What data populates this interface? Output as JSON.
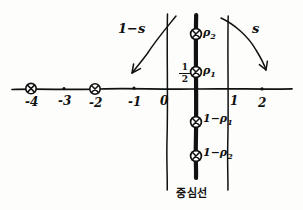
{
  "figure": {
    "kind": "hand-drawn-diagram",
    "ink_color": "#111111",
    "paper_color": "#fdfdfb"
  },
  "axis": {
    "label": "real axis",
    "ticks": [
      {
        "value": "-4",
        "x": 31,
        "marker": "circled-x"
      },
      {
        "value": "-3",
        "x": 64,
        "marker": "dot"
      },
      {
        "value": "-2",
        "x": 95,
        "marker": "circled-x"
      },
      {
        "value": "-1",
        "x": 134,
        "marker": "dot"
      },
      {
        "value": "0",
        "x": 167,
        "marker": "line"
      },
      {
        "value": "1",
        "x": 228,
        "marker": "line"
      },
      {
        "value": "2",
        "x": 262,
        "marker": "dot"
      }
    ],
    "half_label": {
      "numerator": "1",
      "denominator": "2"
    }
  },
  "critical_line": {
    "label": "중심선",
    "x": 196
  },
  "strip_bounds": [
    {
      "name": "re-equals-zero-line",
      "x": 167
    },
    {
      "name": "re-equals-one-line",
      "x": 228
    }
  ],
  "zeros": [
    {
      "label": "ρ",
      "sub": "2",
      "x": 196,
      "y": 34,
      "side": "upper"
    },
    {
      "label": "ρ",
      "sub": "1",
      "x": 196,
      "y": 72,
      "side": "upper"
    },
    {
      "label": "1−ρ",
      "sub": "1",
      "x": 196,
      "y": 122,
      "side": "lower"
    },
    {
      "label": "1−ρ",
      "sub": "2",
      "x": 196,
      "y": 156,
      "side": "lower"
    }
  ],
  "annotations": [
    {
      "name": "one-minus-s",
      "text": "1−s",
      "x": 124,
      "y": 22
    },
    {
      "name": "s",
      "text": "s",
      "x": 255,
      "y": 22
    }
  ]
}
